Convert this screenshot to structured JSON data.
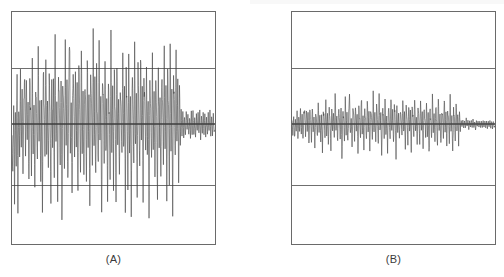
{
  "figure": {
    "background_color": "#ffffff",
    "border_color": "#6a6a6a",
    "trace_color": "#4a4a4a",
    "gridline_color": "#6f6f6f",
    "zeroline_color": "#3c3c3c"
  },
  "panels": [
    {
      "id": "A",
      "caption": "(A)",
      "x": 11,
      "y": 11,
      "width": 205,
      "height": 234
    },
    {
      "id": "B",
      "caption": "(B)",
      "x": 291,
      "y": 11,
      "width": 205,
      "height": 234
    }
  ],
  "chart_data": [
    {
      "type": "line",
      "title": "(A)",
      "subtitle": "",
      "xlabel": "",
      "ylabel": "",
      "grid": true,
      "gridlines_y": [
        1.0,
        0.0,
        -1.0
      ],
      "legend": "none",
      "xlim": [
        0,
        240
      ],
      "ylim": [
        -2.0,
        2.0
      ],
      "series": [
        {
          "name": "signal-a",
          "description": "high-amplitude spiky residual series, activity ends near x=208",
          "x": [
            0,
            1,
            2,
            3,
            4,
            5,
            6,
            7,
            8,
            9,
            10,
            11,
            12,
            13,
            14,
            15,
            16,
            17,
            18,
            19,
            20,
            21,
            22,
            23,
            24,
            25,
            26,
            27,
            28,
            29,
            30,
            31,
            32,
            33,
            34,
            35,
            36,
            37,
            38,
            39,
            40,
            41,
            42,
            43,
            44,
            45,
            46,
            47,
            48,
            49,
            50,
            51,
            52,
            53,
            54,
            55,
            56,
            57,
            58,
            59,
            60,
            61,
            62,
            63,
            64,
            65,
            66,
            67,
            68,
            69,
            70,
            71,
            72,
            73,
            74,
            75,
            76,
            77,
            78,
            79,
            80,
            81,
            82,
            83,
            84,
            85,
            86,
            87,
            88,
            89,
            90,
            91,
            92,
            93,
            94,
            95,
            96,
            97,
            98,
            99,
            100,
            101,
            102,
            103,
            104,
            105,
            106,
            107,
            108,
            109,
            110,
            111,
            112,
            113,
            114,
            115,
            116,
            117,
            118,
            119,
            120,
            121,
            122,
            123,
            124,
            125,
            126,
            127,
            128,
            129,
            130,
            131,
            132,
            133,
            134,
            135,
            136,
            137,
            138,
            139,
            140,
            141,
            142,
            143,
            144,
            145,
            146,
            147,
            148,
            149,
            150,
            151,
            152,
            153,
            154,
            155,
            156,
            157,
            158,
            159,
            160,
            161,
            162,
            163,
            164,
            165,
            166,
            167,
            168,
            169,
            170,
            171,
            172,
            173,
            174,
            175,
            176,
            177,
            178,
            179,
            180,
            181,
            182,
            183,
            184,
            185,
            186,
            187,
            188,
            189,
            190,
            191,
            192,
            193,
            194,
            195,
            196,
            197,
            198,
            199,
            200,
            201,
            202,
            203,
            204,
            205,
            206,
            207,
            208,
            209,
            210,
            211,
            212,
            213,
            214,
            215,
            216,
            217,
            218,
            219,
            220,
            221,
            222,
            223,
            224,
            225,
            226,
            227,
            228,
            229,
            230,
            231,
            232,
            233,
            234,
            235,
            236,
            237,
            238,
            239
          ],
          "values": [
            -0.25,
            -0.95,
            0.42,
            -1.18,
            0.18,
            -0.72,
            0.85,
            -1.35,
            0.3,
            -0.55,
            0.95,
            -0.4,
            0.62,
            -1.05,
            0.48,
            0.72,
            -0.62,
            1.05,
            -0.35,
            0.52,
            -1.12,
            0.78,
            0.25,
            -0.88,
            0.95,
            -0.48,
            0.35,
            -1.25,
            0.68,
            0.15,
            -0.75,
            1.18,
            -0.32,
            0.58,
            -0.95,
            0.42,
            -1.45,
            0.88,
            0.32,
            -0.62,
            1.25,
            -0.55,
            0.45,
            -1.05,
            0.72,
            0.18,
            -1.32,
            0.95,
            -0.42,
            0.65,
            -0.88,
            1.55,
            -0.35,
            0.48,
            -1.15,
            0.82,
            0.28,
            -0.68,
            1.02,
            -1.62,
            0.55,
            0.38,
            -0.95,
            1.28,
            -0.45,
            0.72,
            -1.08,
            0.52,
            1.72,
            -0.58,
            0.35,
            -1.22,
            0.88,
            0.42,
            -0.75,
            1.15,
            -0.38,
            0.62,
            -1.45,
            0.95,
            0.25,
            -0.85,
            1.65,
            -0.52,
            0.48,
            -1.18,
            0.78,
            0.35,
            -0.95,
            1.22,
            -0.42,
            0.58,
            -1.55,
            0.85,
            0.32,
            -0.72,
            1.48,
            -0.48,
            0.68,
            -1.12,
            0.92,
            0.22,
            -0.88,
            1.35,
            -0.35,
            0.52,
            -1.68,
            0.75,
            0.45,
            -0.62,
            1.08,
            -0.55,
            0.38,
            -1.28,
            0.95,
            0.18,
            -0.82,
            1.42,
            -0.45,
            0.65,
            -1.02,
            0.88,
            0.28,
            -1.55,
            1.18,
            -0.38,
            0.48,
            -0.92,
            0.72,
            0.35,
            -0.68,
            1.32,
            -0.52,
            0.55,
            -1.38,
            0.85,
            0.22,
            -0.95,
            1.12,
            -0.42,
            0.62,
            -1.62,
            0.78,
            0.38,
            -0.72,
            1.25,
            -0.48,
            0.45,
            -1.08,
            0.92,
            0.15,
            -0.85,
            1.45,
            -0.35,
            0.68,
            -1.18,
            0.82,
            0.32,
            -0.62,
            1.05,
            -0.58,
            0.52,
            -1.72,
            0.88,
            0.25,
            -0.78,
            1.38,
            -0.45,
            0.58,
            -0.98,
            0.95,
            0.18,
            -1.42,
            1.15,
            -0.38,
            0.48,
            -1.25,
            0.72,
            0.42,
            -0.68,
            1.52,
            -0.55,
            0.62,
            -1.12,
            0.85,
            0.28,
            -0.92,
            1.28,
            -0.48,
            0.55,
            -1.58,
            0.78,
            0.35,
            -0.75,
            1.18,
            -0.42,
            0.68,
            -1.05,
            0.88,
            -0.32,
            0.25,
            -0.18,
            0.22,
            -0.28,
            0.15,
            -0.2,
            0.26,
            -0.12,
            0.18,
            -0.24,
            0.14,
            -0.22,
            0.2,
            -0.16,
            0.24,
            -0.18,
            0.12,
            -0.26,
            0.16,
            -0.14,
            0.22,
            -0.18,
            0.2,
            -0.24,
            0.14,
            -0.18,
            0.22,
            -0.16,
            0.18,
            -0.2,
            0.15,
            -0.22,
            0.18,
            -0.14,
            0.2,
            -0.18,
            0.16,
            -0.2,
            0.17,
            -0.15,
            0.19
          ]
        }
      ]
    },
    {
      "type": "line",
      "title": "(B)",
      "subtitle": "",
      "xlabel": "",
      "ylabel": "",
      "grid": true,
      "gridlines_y": [
        1.0,
        0.0,
        -1.0
      ],
      "legend": "none",
      "xlim": [
        0,
        240
      ],
      "ylim": [
        -2.0,
        2.0
      ],
      "series": [
        {
          "name": "signal-b",
          "description": "low-amplitude residual noise tightly centred on zero, flattens near x=208",
          "x": [
            0,
            1,
            2,
            3,
            4,
            5,
            6,
            7,
            8,
            9,
            10,
            11,
            12,
            13,
            14,
            15,
            16,
            17,
            18,
            19,
            20,
            21,
            22,
            23,
            24,
            25,
            26,
            27,
            28,
            29,
            30,
            31,
            32,
            33,
            34,
            35,
            36,
            37,
            38,
            39,
            40,
            41,
            42,
            43,
            44,
            45,
            46,
            47,
            48,
            49,
            50,
            51,
            52,
            53,
            54,
            55,
            56,
            57,
            58,
            59,
            60,
            61,
            62,
            63,
            64,
            65,
            66,
            67,
            68,
            69,
            70,
            71,
            72,
            73,
            74,
            75,
            76,
            77,
            78,
            79,
            80,
            81,
            82,
            83,
            84,
            85,
            86,
            87,
            88,
            89,
            90,
            91,
            92,
            93,
            94,
            95,
            96,
            97,
            98,
            99,
            100,
            101,
            102,
            103,
            104,
            105,
            106,
            107,
            108,
            109,
            110,
            111,
            112,
            113,
            114,
            115,
            116,
            117,
            118,
            119,
            120,
            121,
            122,
            123,
            124,
            125,
            126,
            127,
            128,
            129,
            130,
            131,
            132,
            133,
            134,
            135,
            136,
            137,
            138,
            139,
            140,
            141,
            142,
            143,
            144,
            145,
            146,
            147,
            148,
            149,
            150,
            151,
            152,
            153,
            154,
            155,
            156,
            157,
            158,
            159,
            160,
            161,
            162,
            163,
            164,
            165,
            166,
            167,
            168,
            169,
            170,
            171,
            172,
            173,
            174,
            175,
            176,
            177,
            178,
            179,
            180,
            181,
            182,
            183,
            184,
            185,
            186,
            187,
            188,
            189,
            190,
            191,
            192,
            193,
            194,
            195,
            196,
            197,
            198,
            199,
            200,
            201,
            202,
            203,
            204,
            205,
            206,
            207,
            208,
            209,
            210,
            211,
            212,
            213,
            214,
            215,
            216,
            217,
            218,
            219,
            220,
            221,
            222,
            223,
            224,
            225,
            226,
            227,
            228,
            229,
            230,
            231,
            232,
            233,
            234,
            235,
            236,
            237,
            238,
            239
          ],
          "values": [
            0.05,
            -0.18,
            0.12,
            -0.25,
            0.08,
            -0.15,
            0.22,
            -0.3,
            0.1,
            -0.12,
            0.28,
            -0.2,
            0.15,
            -0.35,
            0.18,
            0.25,
            -0.22,
            0.32,
            -0.14,
            0.2,
            -0.38,
            0.26,
            0.09,
            -0.28,
            0.3,
            -0.18,
            0.12,
            -0.42,
            0.24,
            0.06,
            -0.25,
            0.38,
            -0.12,
            0.2,
            -0.32,
            0.15,
            -0.48,
            0.28,
            0.11,
            -0.22,
            0.4,
            -0.18,
            0.16,
            -0.35,
            0.24,
            0.07,
            -0.44,
            0.3,
            -0.15,
            0.22,
            -0.28,
            0.52,
            -0.12,
            0.18,
            -0.38,
            0.26,
            0.1,
            -0.24,
            0.34,
            -0.55,
            0.2,
            0.13,
            -0.32,
            0.42,
            -0.16,
            0.24,
            -0.36,
            0.18,
            0.58,
            -0.2,
            0.12,
            -0.4,
            0.3,
            0.14,
            -0.26,
            0.38,
            -0.13,
            0.22,
            -0.48,
            0.32,
            0.09,
            -0.28,
            0.55,
            -0.18,
            0.16,
            -0.38,
            0.26,
            0.12,
            -0.32,
            0.4,
            -0.15,
            0.2,
            -0.52,
            0.28,
            0.11,
            -0.24,
            0.5,
            -0.16,
            0.23,
            -0.36,
            0.31,
            0.08,
            -0.3,
            0.45,
            -0.12,
            0.18,
            -0.56,
            0.25,
            0.15,
            -0.22,
            0.36,
            -0.18,
            0.13,
            -0.42,
            0.32,
            0.06,
            -0.28,
            0.48,
            -0.15,
            0.22,
            -0.34,
            0.3,
            0.1,
            -0.52,
            0.4,
            -0.13,
            0.16,
            -0.31,
            0.24,
            0.12,
            -0.23,
            0.44,
            -0.17,
            0.19,
            -0.46,
            0.28,
            0.08,
            -0.32,
            0.38,
            -0.14,
            0.21,
            -0.54,
            0.26,
            0.13,
            -0.24,
            0.42,
            -0.16,
            0.15,
            -0.36,
            0.31,
            0.05,
            -0.29,
            0.48,
            -0.12,
            0.23,
            -0.4,
            0.27,
            0.11,
            -0.21,
            0.35,
            -0.19,
            0.18,
            -0.57,
            0.3,
            0.09,
            -0.26,
            0.46,
            -0.15,
            0.2,
            -0.33,
            0.32,
            0.06,
            -0.47,
            0.39,
            -0.13,
            0.16,
            -0.42,
            0.24,
            0.14,
            -0.23,
            0.51,
            -0.18,
            0.21,
            -0.38,
            0.29,
            0.1,
            -0.31,
            0.43,
            -0.16,
            0.19,
            -0.53,
            0.26,
            0.12,
            -0.25,
            0.4,
            -0.14,
            0.23,
            -0.35,
            0.3,
            -0.11,
            0.08,
            -0.06,
            0.07,
            -0.09,
            0.05,
            -0.07,
            0.09,
            -0.04,
            0.06,
            -0.08,
            0.05,
            -0.07,
            0.07,
            -0.05,
            0.08,
            -0.06,
            0.04,
            -0.09,
            0.05,
            -0.05,
            0.07,
            -0.06,
            0.07,
            -0.08,
            0.05,
            -0.06,
            0.07,
            -0.05,
            0.06,
            -0.07,
            0.05,
            -0.07,
            0.06,
            -0.05,
            0.07,
            -0.06,
            0.05,
            -0.07,
            0.06,
            -0.05,
            0.06
          ]
        }
      ]
    }
  ]
}
